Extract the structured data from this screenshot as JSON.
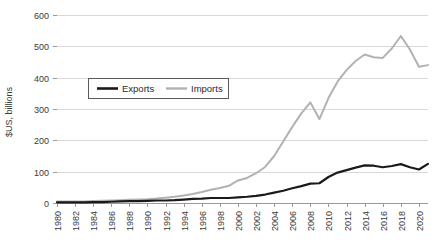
{
  "chart_data": {
    "type": "line",
    "title": "",
    "xlabel": "",
    "ylabel": "$US, billions",
    "xlim": [
      1980,
      2021
    ],
    "ylim": [
      0,
      600
    ],
    "ytick_step": 100,
    "yticks": [
      0,
      100,
      200,
      300,
      400,
      500,
      600
    ],
    "ytick_labels": [
      "0",
      "100",
      "200",
      "300",
      "400",
      "500",
      "600"
    ],
    "xticks": [
      1980,
      1982,
      1984,
      1986,
      1988,
      1990,
      1992,
      1994,
      1996,
      1998,
      2000,
      2002,
      2004,
      2006,
      2008,
      2010,
      2012,
      2014,
      2016,
      2018,
      2020
    ],
    "xtick_labels": [
      "1980",
      "1982",
      "1984",
      "1986",
      "1988",
      "1990",
      "1992",
      "1994",
      "1996",
      "1998",
      "2000",
      "2002",
      "2004",
      "2006",
      "2008",
      "2010",
      "2012",
      "2014",
      "2016",
      "2018",
      "2020"
    ],
    "xtick_rotation": -90,
    "grid": "horizontal",
    "legend_position": "upper-left-inside",
    "x": [
      1980,
      1981,
      1982,
      1983,
      1984,
      1985,
      1986,
      1987,
      1988,
      1989,
      1990,
      1991,
      1992,
      1993,
      1994,
      1995,
      1996,
      1997,
      1998,
      1999,
      2000,
      2001,
      2002,
      2003,
      2004,
      2005,
      2006,
      2007,
      2008,
      2009,
      2010,
      2011,
      2012,
      2013,
      2014,
      2015,
      2016,
      2017,
      2018,
      2019,
      2020,
      2021
    ],
    "series": [
      {
        "name": "Exports",
        "color": "#1a1a1a",
        "width": 2.2,
        "values": [
          2,
          2,
          2,
          2,
          3,
          3,
          4,
          5,
          6,
          6,
          7,
          8,
          8,
          9,
          11,
          13,
          14,
          16,
          16,
          16,
          18,
          20,
          23,
          27,
          33,
          39,
          47,
          54,
          62,
          63,
          83,
          97,
          105,
          113,
          120,
          119,
          114,
          118,
          124,
          114,
          107,
          125
        ]
      },
      {
        "name": "Imports",
        "color": "#b2b2b2",
        "width": 2.0,
        "values": [
          5,
          5,
          5,
          5,
          6,
          7,
          8,
          9,
          10,
          11,
          12,
          14,
          17,
          20,
          24,
          29,
          35,
          42,
          48,
          55,
          72,
          80,
          95,
          115,
          150,
          196,
          243,
          286,
          321,
          268,
          335,
          387,
          424,
          453,
          474,
          465,
          463,
          493,
          533,
          490,
          435,
          440
        ]
      }
    ]
  }
}
